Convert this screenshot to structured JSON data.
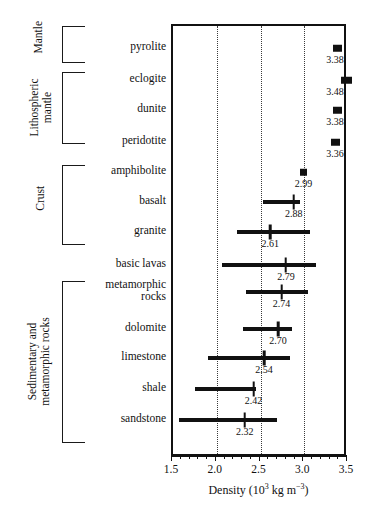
{
  "chart_data": {
    "type": "bar",
    "title": "",
    "xlabel": "Density (10^3 kg m^-3)",
    "ylabel": "",
    "xlim": [
      1.5,
      3.5
    ],
    "grid": "vertical-dotted",
    "legend": "none",
    "axis": {
      "title_main": "Density (10",
      "title_exp": "3",
      "title_unit": " kg m",
      "title_unit_exp": "−3",
      "title_close": ")",
      "ticks": [
        {
          "value": 1.5,
          "label": "1.5"
        },
        {
          "value": 2.0,
          "label": "2.0"
        },
        {
          "value": 2.5,
          "label": "2.5"
        },
        {
          "value": 3.0,
          "label": "3.0"
        },
        {
          "value": 3.5,
          "label": "3.5"
        }
      ],
      "gridlines": [
        2.0,
        2.5,
        3.0
      ]
    },
    "groups": [
      {
        "name": "Mantle",
        "label": "Mantle",
        "rows": [
          "pyrolite"
        ]
      },
      {
        "name": "Lithospheric mantle",
        "label": "Lithospheric\nmantle",
        "rows": [
          "eclogite",
          "dunite",
          "peridotite"
        ]
      },
      {
        "name": "Crust",
        "label": "Crust",
        "rows": [
          "amphibolite",
          "basalt",
          "granite"
        ]
      },
      {
        "name": "Sedimentary and metamorphic rocks",
        "label": "Sedimentary and\nmetamorphic rocks",
        "rows": [
          "metamorphic rocks",
          "dolomite",
          "limestone",
          "shale",
          "sandstone"
        ]
      }
    ],
    "rows": [
      {
        "label": "pyrolite",
        "mark": "point",
        "mean": 3.38,
        "value_label": "3.38",
        "low": 3.3,
        "high": 3.4
      },
      {
        "label": "eclogite",
        "mark": "point",
        "mean": 3.48,
        "value_label": "3.48",
        "low": 3.38,
        "high": 3.5
      },
      {
        "label": "dunite",
        "mark": "point",
        "mean": 3.38,
        "value_label": "3.38",
        "low": 3.3,
        "high": 3.4
      },
      {
        "label": "peridotite",
        "mark": "point",
        "mean": 3.36,
        "value_label": "3.36",
        "low": 3.29,
        "high": 3.39
      },
      {
        "label": "amphibolite",
        "mark": "point",
        "mean": 2.99,
        "value_label": "2.99",
        "low": 2.96,
        "high": 3.01
      },
      {
        "label": "basalt",
        "mark": "range",
        "mean": 2.88,
        "value_label": "2.88",
        "low": 2.53,
        "high": 2.95
      },
      {
        "label": "granite",
        "mark": "range",
        "mean": 2.61,
        "value_label": "2.61",
        "low": 2.23,
        "high": 3.07
      },
      {
        "label": "basic lavas",
        "mark": "range",
        "mean": 2.79,
        "value_label": "2.79",
        "low": 2.06,
        "high": 3.13
      },
      {
        "label": "metamorphic\nrocks",
        "mark": "range",
        "mean": 2.74,
        "value_label": "2.74",
        "low": 2.33,
        "high": 3.04
      },
      {
        "label": "dolomite",
        "mark": "range",
        "mean": 2.7,
        "value_label": "2.70",
        "low": 2.3,
        "high": 2.86
      },
      {
        "label": "limestone",
        "mark": "range",
        "mean": 2.54,
        "value_label": "2.54",
        "low": 1.9,
        "high": 2.84
      },
      {
        "label": "shale",
        "mark": "range",
        "mean": 2.42,
        "value_label": "2.42",
        "low": 1.75,
        "high": 2.45
      },
      {
        "label": "sandstone",
        "mark": "range",
        "mean": 2.32,
        "value_label": "2.32",
        "low": 1.57,
        "high": 2.69
      }
    ]
  }
}
